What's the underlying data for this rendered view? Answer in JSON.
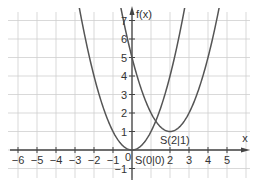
{
  "chart_data": {
    "type": "line",
    "title": "",
    "xlabel": "x",
    "ylabel": "f(x)",
    "xlim": [
      -6.6,
      6.0
    ],
    "ylim": [
      -1.6,
      7.7
    ],
    "grid": true,
    "legend": null,
    "x_ticks": [
      -6,
      -5,
      -4,
      -3,
      -2,
      -1,
      0,
      2,
      3,
      4,
      5
    ],
    "x_tick_labels": [
      "−6",
      "−5",
      "−4",
      "−3",
      "−2",
      "−1",
      "0",
      "2",
      "3",
      "4",
      "5"
    ],
    "y_ticks": [
      -1,
      1,
      2,
      3,
      4,
      5,
      6,
      7
    ],
    "y_tick_labels": [
      "−1",
      "1",
      "2",
      "3",
      "4",
      "5",
      "6",
      "7"
    ],
    "series": [
      {
        "name": "f(x) = x²",
        "formula": "x^2",
        "vertex": [
          0,
          0
        ],
        "x": [
          -2.75,
          -2,
          -1,
          0,
          1,
          2,
          2.75
        ],
        "values": [
          7.56,
          4,
          1,
          0,
          1,
          4,
          7.56
        ]
      },
      {
        "name": "g(x) = (x−2)² + 1",
        "formula": "(x-2)^2+1",
        "vertex": [
          2,
          1
        ],
        "x": [
          -0.6,
          0,
          1,
          2,
          3,
          4,
          5,
          5.8
        ],
        "values": [
          7.76,
          5,
          2,
          1,
          2,
          5,
          10,
          15.44
        ]
      }
    ],
    "annotations": [
      {
        "text": "S(0|0)",
        "x": 0,
        "y": 0
      },
      {
        "text": "S(2|1)",
        "x": 2,
        "y": 1
      }
    ]
  },
  "labels": {
    "x_axis": "x",
    "y_axis": "f(x)",
    "vertex1": "S(0|0)",
    "vertex2": "S(2|1)",
    "origin": "0"
  },
  "colors": {
    "grid": "#cfcfcf",
    "axis": "#444444",
    "curve": "#555555",
    "text": "#333333"
  }
}
